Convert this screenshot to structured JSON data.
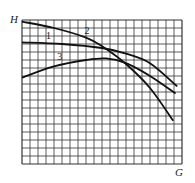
{
  "chart_data": {
    "type": "line",
    "title": "",
    "xlabel": "G",
    "ylabel": "H",
    "grid": true,
    "grid_cols": 20,
    "grid_rows": 18,
    "tick_labels": {
      "x": [],
      "y": []
    },
    "legend": "none (curves labeled inline 1, 2, 3)",
    "xlim": [
      0,
      20
    ],
    "ylim": [
      0,
      18
    ],
    "series": [
      {
        "name": "1",
        "label_pos": [
          3,
          15.6
        ],
        "points": [
          [
            0,
            15.2
          ],
          [
            5,
            15.0
          ],
          [
            10,
            14.5
          ],
          [
            13,
            13.8
          ],
          [
            16,
            12.6
          ],
          [
            19.4,
            9.7
          ]
        ]
      },
      {
        "name": "2",
        "label_pos": [
          7.8,
          16.3
        ],
        "points": [
          [
            0,
            17.8
          ],
          [
            4,
            17.0
          ],
          [
            8,
            15.8
          ],
          [
            10.2,
            14.6
          ],
          [
            13,
            12.5
          ],
          [
            16,
            9.5
          ],
          [
            18.9,
            5.4
          ]
        ]
      },
      {
        "name": "3",
        "label_pos": [
          4.4,
          13.0
        ],
        "points": [
          [
            0,
            10.8
          ],
          [
            4,
            12.2
          ],
          [
            8,
            13.0
          ],
          [
            10.5,
            13.2
          ],
          [
            13,
            12.6
          ],
          [
            16,
            11.0
          ],
          [
            19.2,
            8.8
          ]
        ]
      }
    ]
  },
  "axes": {
    "x_label": "G",
    "y_label": "H"
  },
  "colors": {
    "grid": "#333333",
    "curve": "#111111",
    "background": "#ffffff"
  }
}
